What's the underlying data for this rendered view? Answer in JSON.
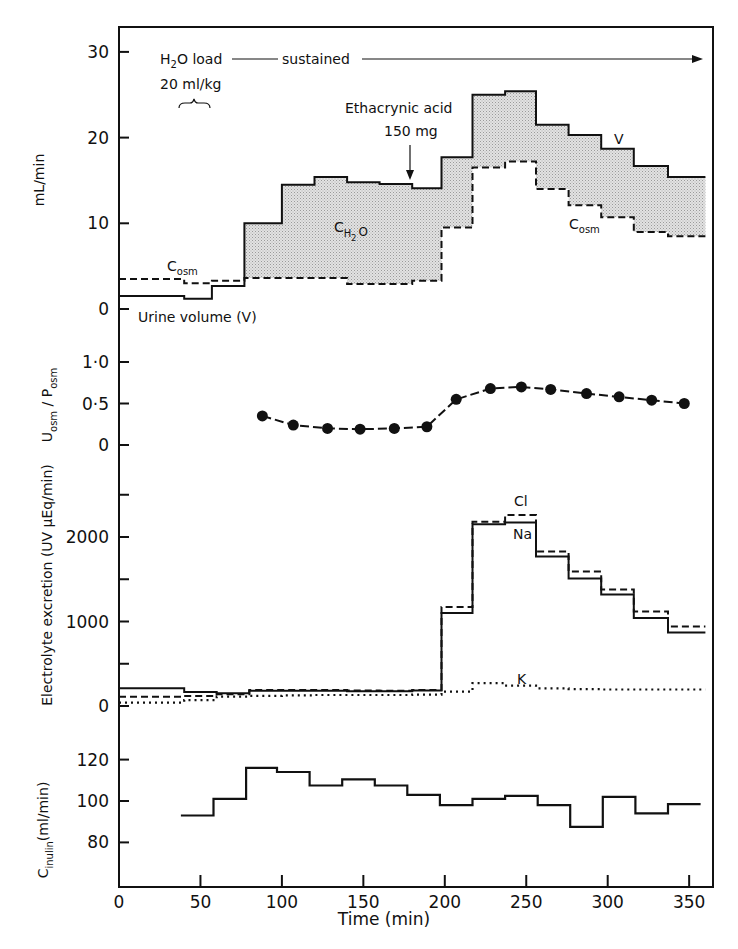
{
  "chart_data": [
    {
      "type": "line",
      "panel": "volume",
      "title": "",
      "ylabel": "mL/min",
      "xlabel": "",
      "xlim": [
        0,
        365
      ],
      "ylim": [
        -3,
        33
      ],
      "yticks": [
        "0",
        "10",
        "20",
        "30"
      ],
      "ytick_values": [
        0,
        10,
        20,
        30
      ],
      "step_edges": [
        0,
        40,
        57,
        77,
        100,
        120,
        140,
        160,
        180,
        198,
        217,
        237,
        256,
        276,
        296,
        316,
        337,
        360
      ],
      "series": [
        {
          "name": "Urine volume (V)",
          "style": "solid",
          "values": [
            1.5,
            1.2,
            2.7,
            10.0,
            14.5,
            15.4,
            14.8,
            14.6,
            14.1,
            17.7,
            25.0,
            25.4,
            21.5,
            20.3,
            18.7,
            16.7,
            15.4
          ]
        },
        {
          "name": "Cosm",
          "style": "dashed",
          "values": [
            3.5,
            3.0,
            3.3,
            3.6,
            3.6,
            3.6,
            2.9,
            2.9,
            3.3,
            9.5,
            16.5,
            17.2,
            14.0,
            12.1,
            10.7,
            9.0,
            8.5
          ]
        }
      ],
      "shaded_region": {
        "label": "CH2O",
        "between": [
          "Urine volume (V)",
          "Cosm"
        ],
        "from": 77
      },
      "annotations": {
        "h2o_load": "H2O load",
        "h2o_sub": "2",
        "sustained": "sustained",
        "dose": "20 ml/kg",
        "drug": "Ethacrynic acid",
        "drug_dose": "150 mg",
        "drug_time": 178,
        "v_label": "V",
        "cosm_label_main": "C",
        "cosm_label_sub": "osm",
        "ch2o_main": "C",
        "ch2o_sub": "H2",
        "ch2o_tail": "O",
        "urine_volume": "Urine volume (V)"
      }
    },
    {
      "type": "scatter",
      "panel": "osmolality_ratio",
      "ylabel_main": "U",
      "ylabel_sub1": "osm",
      "ylabel_mid": " / P",
      "ylabel_sub2": "osm",
      "ylim": [
        -0.1,
        1.2
      ],
      "yticks": [
        "0",
        "0·5",
        "1·0"
      ],
      "ytick_values": [
        0,
        0.5,
        1.0
      ],
      "x": [
        88,
        107,
        128,
        148,
        169,
        189,
        207,
        228,
        247,
        265,
        287,
        307,
        327,
        347
      ],
      "values": [
        0.35,
        0.24,
        0.2,
        0.19,
        0.2,
        0.22,
        0.55,
        0.68,
        0.7,
        0.67,
        0.62,
        0.58,
        0.54,
        0.5
      ]
    },
    {
      "type": "line",
      "panel": "electrolytes",
      "ylabel": "Electrolyte excretion (UV μEq/min)",
      "ylim": [
        -100,
        2900
      ],
      "yticks": [
        "0",
        "1000",
        "2000"
      ],
      "ytick_values": [
        0,
        1000,
        2000
      ],
      "minor_ticks": [
        500,
        1500,
        2500
      ],
      "step_edges": [
        0,
        40,
        60,
        80,
        100,
        120,
        140,
        160,
        180,
        198,
        217,
        237,
        256,
        276,
        296,
        316,
        337,
        360
      ],
      "series": [
        {
          "name": "Na",
          "style": "solid",
          "values": [
            210,
            165,
            150,
            180,
            180,
            180,
            175,
            175,
            185,
            1100,
            2150,
            2170,
            1770,
            1510,
            1320,
            1040,
            870
          ]
        },
        {
          "name": "Cl",
          "style": "dashed",
          "values": [
            110,
            120,
            140,
            190,
            190,
            190,
            185,
            180,
            190,
            1170,
            2180,
            2260,
            1830,
            1590,
            1380,
            1120,
            940
          ]
        },
        {
          "name": "K",
          "style": "dotted",
          "values": [
            40,
            70,
            110,
            120,
            125,
            130,
            130,
            130,
            135,
            170,
            270,
            240,
            210,
            200,
            195,
            195,
            195
          ]
        }
      ],
      "labels": {
        "cl": "Cl",
        "na": "Na",
        "k": "K"
      }
    },
    {
      "type": "line",
      "panel": "inulin_clearance",
      "ylabel_main": "C",
      "ylabel_sub": "inulin",
      "ylabel_tail": "(ml/min)",
      "xlabel": "Time (min)",
      "xlim": [
        0,
        365
      ],
      "ylim": [
        62,
        131
      ],
      "yticks": [
        "80",
        "100",
        "120"
      ],
      "ytick_values": [
        80,
        100,
        120
      ],
      "xticks": [
        "0",
        "50",
        "100",
        "150",
        "200",
        "250",
        "300",
        "350"
      ],
      "xtick_values": [
        0,
        50,
        100,
        150,
        200,
        250,
        300,
        350
      ],
      "step_edges": [
        38,
        58,
        78,
        97,
        117,
        137,
        157,
        177,
        197,
        217,
        237,
        257,
        277,
        297,
        317,
        337,
        357
      ],
      "series": [
        {
          "name": "Cinulin",
          "style": "solid",
          "values": [
            93,
            101,
            116,
            114,
            107.5,
            110.5,
            107.5,
            103,
            98,
            101,
            102.5,
            98,
            87.5,
            102,
            94,
            98.5
          ]
        }
      ]
    }
  ]
}
